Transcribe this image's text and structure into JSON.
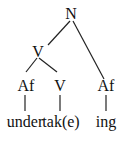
{
  "tree": {
    "root": {
      "label": "N"
    },
    "verb_node": {
      "label": "V"
    },
    "prefix_node": {
      "label": "Af"
    },
    "stem_node": {
      "label": "V"
    },
    "suffix_node": {
      "label": "Af"
    },
    "leaves": {
      "prefix": "under",
      "stem": "tak(e)",
      "suffix": "ing"
    }
  }
}
